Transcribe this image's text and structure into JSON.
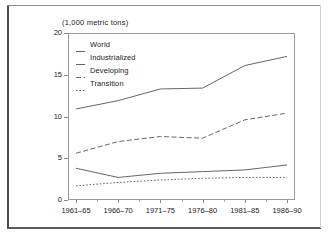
{
  "chart_data": {
    "type": "line",
    "title": "(1,000 metric tons)",
    "xlabel": "",
    "ylabel": "",
    "ylim": [
      0,
      20
    ],
    "yticks": [
      "0",
      "5",
      "10",
      "15",
      "20"
    ],
    "ytick_values": [
      0,
      5,
      10,
      15,
      20
    ],
    "grid": false,
    "legend_position": "top-left inside plot",
    "categories": [
      "1961–65",
      "1966–70",
      "1971–75",
      "1976–80",
      "1981–85",
      "1986–90"
    ],
    "series": [
      {
        "name": "World",
        "style": "solid",
        "color": "#555555",
        "values": [
          10.9,
          11.9,
          13.3,
          13.4,
          16.1,
          17.2
        ]
      },
      {
        "name": "Industrialized",
        "style": "solid",
        "color": "#555555",
        "values": [
          3.8,
          2.7,
          3.2,
          3.4,
          3.6,
          4.2
        ]
      },
      {
        "name": "Developing",
        "style": "dashed",
        "color": "#555555",
        "values": [
          5.6,
          7.0,
          7.6,
          7.4,
          9.6,
          10.4
        ]
      },
      {
        "name": "Transition",
        "style": "dotted",
        "color": "#555555",
        "values": [
          1.7,
          2.1,
          2.4,
          2.6,
          2.7,
          2.7
        ]
      }
    ]
  },
  "legend": {
    "items": [
      {
        "label": "World",
        "style": "solid"
      },
      {
        "label": "Industrialized",
        "style": "solid"
      },
      {
        "label": "Developing",
        "style": "dashed"
      },
      {
        "label": "Transition",
        "style": "dotted"
      }
    ]
  },
  "colors": {
    "axis": "#9a9a9a",
    "line": "#555555",
    "text": "#1a1a1a",
    "background": "#ffffff"
  }
}
